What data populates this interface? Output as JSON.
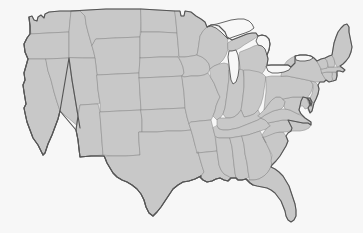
{
  "map": {
    "title": "United States",
    "projection": "albers-usa",
    "region_scope": "contiguous-48-states",
    "background_color": "#f7f7f7",
    "state_fill_color": "#c8c8c8",
    "state_border_color": "#8a8a8a",
    "nation_border_color": "#565656",
    "lake_fill_color": "#f7f7f7",
    "labels_visible": "false",
    "legend_visible": "false",
    "states": [
      {
        "code": "WA",
        "name": "Washington"
      },
      {
        "code": "OR",
        "name": "Oregon"
      },
      {
        "code": "CA",
        "name": "California"
      },
      {
        "code": "NV",
        "name": "Nevada"
      },
      {
        "code": "ID",
        "name": "Idaho"
      },
      {
        "code": "MT",
        "name": "Montana"
      },
      {
        "code": "WY",
        "name": "Wyoming"
      },
      {
        "code": "UT",
        "name": "Utah"
      },
      {
        "code": "AZ",
        "name": "Arizona"
      },
      {
        "code": "NM",
        "name": "New Mexico"
      },
      {
        "code": "CO",
        "name": "Colorado"
      },
      {
        "code": "ND",
        "name": "North Dakota"
      },
      {
        "code": "SD",
        "name": "South Dakota"
      },
      {
        "code": "NE",
        "name": "Nebraska"
      },
      {
        "code": "KS",
        "name": "Kansas"
      },
      {
        "code": "OK",
        "name": "Oklahoma"
      },
      {
        "code": "TX",
        "name": "Texas"
      },
      {
        "code": "MN",
        "name": "Minnesota"
      },
      {
        "code": "IA",
        "name": "Iowa"
      },
      {
        "code": "MO",
        "name": "Missouri"
      },
      {
        "code": "AR",
        "name": "Arkansas"
      },
      {
        "code": "LA",
        "name": "Louisiana"
      },
      {
        "code": "WI",
        "name": "Wisconsin"
      },
      {
        "code": "IL",
        "name": "Illinois"
      },
      {
        "code": "MI",
        "name": "Michigan"
      },
      {
        "code": "IN",
        "name": "Indiana"
      },
      {
        "code": "OH",
        "name": "Ohio"
      },
      {
        "code": "KY",
        "name": "Kentucky"
      },
      {
        "code": "TN",
        "name": "Tennessee"
      },
      {
        "code": "MS",
        "name": "Mississippi"
      },
      {
        "code": "AL",
        "name": "Alabama"
      },
      {
        "code": "GA",
        "name": "Georgia"
      },
      {
        "code": "FL",
        "name": "Florida"
      },
      {
        "code": "SC",
        "name": "South Carolina"
      },
      {
        "code": "NC",
        "name": "North Carolina"
      },
      {
        "code": "VA",
        "name": "Virginia"
      },
      {
        "code": "WV",
        "name": "West Virginia"
      },
      {
        "code": "MD",
        "name": "Maryland"
      },
      {
        "code": "DE",
        "name": "Delaware"
      },
      {
        "code": "PA",
        "name": "Pennsylvania"
      },
      {
        "code": "NJ",
        "name": "New Jersey"
      },
      {
        "code": "NY",
        "name": "New York"
      },
      {
        "code": "CT",
        "name": "Connecticut"
      },
      {
        "code": "RI",
        "name": "Rhode Island"
      },
      {
        "code": "MA",
        "name": "Massachusetts"
      },
      {
        "code": "VT",
        "name": "Vermont"
      },
      {
        "code": "NH",
        "name": "New Hampshire"
      },
      {
        "code": "ME",
        "name": "Maine"
      }
    ],
    "lakes": [
      {
        "name": "Lake Michigan"
      },
      {
        "name": "Lake Superior"
      },
      {
        "name": "Lake Huron"
      },
      {
        "name": "Lake Erie"
      },
      {
        "name": "Lake Ontario"
      }
    ]
  }
}
